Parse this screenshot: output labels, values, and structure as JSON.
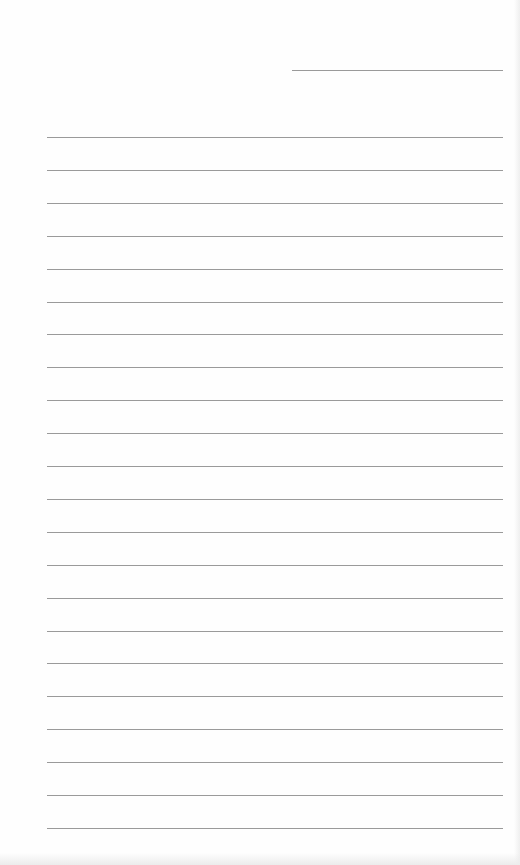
{
  "document": {
    "type": "lined-paper",
    "line_color": "#9a9a9a",
    "background_color": "#fefefe",
    "header_line": {
      "x1": 292,
      "x2": 503,
      "y": 70
    },
    "ruled_lines": {
      "x1": 47,
      "x2": 503,
      "first_y": 137,
      "spacing": 32.9,
      "count": 22
    }
  }
}
